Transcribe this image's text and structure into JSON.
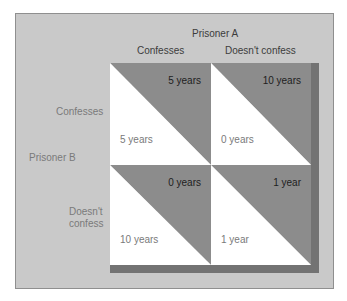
{
  "column_player": "Prisoner A",
  "row_player": "Prisoner B",
  "columns": [
    "Confesses",
    "Doesn't confess"
  ],
  "rows": [
    "Confesses",
    "Doesn't\nconfess"
  ],
  "row_label_lines": [
    [
      "Confesses"
    ],
    [
      "Doesn't",
      "confess"
    ]
  ],
  "cells": [
    [
      {
        "prisoner_a": "5 years",
        "prisoner_b": "5 years"
      },
      {
        "prisoner_a": "10 years",
        "prisoner_b": "0 years"
      }
    ],
    [
      {
        "prisoner_a": "0 years",
        "prisoner_b": "10 years"
      },
      {
        "prisoner_a": "1 year",
        "prisoner_b": "1 year"
      }
    ]
  ],
  "colors": {
    "panel": "#c9c9c9",
    "shaded_triangle": "#8c8c8c",
    "white_triangle": "#ffffff",
    "shadow": "#737373"
  }
}
